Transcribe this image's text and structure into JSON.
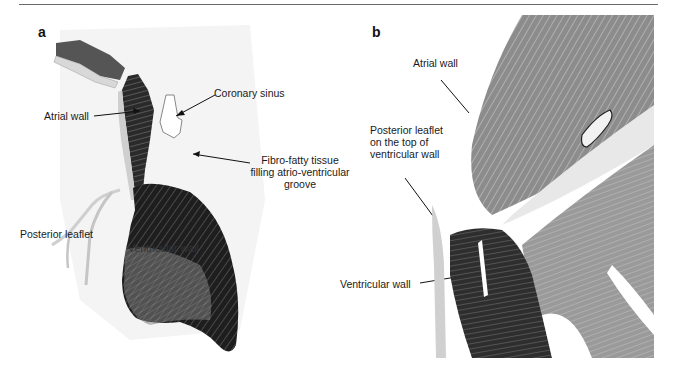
{
  "figure": {
    "panels": [
      {
        "letter": "a",
        "labels": {
          "coronary_sinus": "Coronary sinus",
          "atrial_wall": "Atrial wall",
          "fibro_fatty_line1": "Fibro-fatty tissue",
          "fibro_fatty_line2": "filling atrio-ventricular",
          "fibro_fatty_line3": "groove",
          "posterior_leaflet": "Posterior leaflet",
          "ventricular_wall": "Ventricular wall"
        }
      },
      {
        "letter": "b",
        "labels": {
          "atrial_wall": "Atrial wall",
          "posterior_leaflet_line1": "Posterior leaflet",
          "posterior_leaflet_line2": "on the top of",
          "posterior_leaflet_line3": "ventricular wall",
          "ventricular_wall": "Ventricular wall"
        }
      }
    ]
  }
}
